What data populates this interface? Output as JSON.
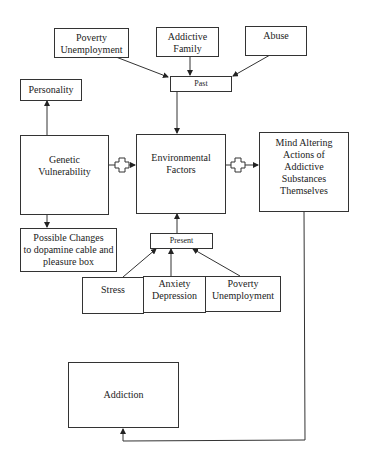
{
  "diagram": {
    "past_factors": [
      {
        "label": "Poverty\nUnemployment"
      },
      {
        "label": "Addictive\nFamily"
      },
      {
        "label": "Abuse"
      }
    ],
    "past_label": "Past",
    "personality_label": "Personality",
    "genetic_label": "Genetic\nVulnerability",
    "environmental_label": "Environmental\nFactors",
    "mind_altering_label": "Mind Altering\nActions of\nAddictive\nSubstances\nThemselves",
    "possible_changes_label": "Possible Changes\nto dopamine cable and\npleasure box",
    "present_label": "Present",
    "present_factors": [
      {
        "label": "Stress"
      },
      {
        "label": "Anxiety\nDepression"
      },
      {
        "label": "Poverty\nUnemployment"
      }
    ],
    "addiction_label": "Addiction",
    "connector_symbol": "plus"
  }
}
